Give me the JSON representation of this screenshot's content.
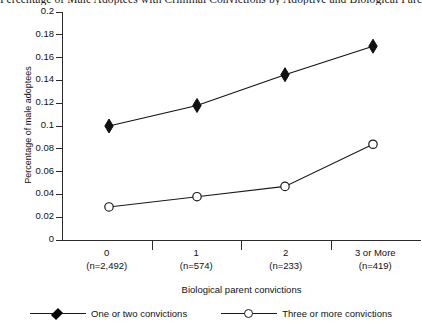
{
  "chart_data": {
    "type": "line",
    "title": "Percentage of Male Adoptees with Criminal Convictions by Adoptive and Biological Parent Criminal Convictions",
    "xlabel": "Biological parent convictions",
    "ylabel": "Percentage of male adoptees",
    "categories": [
      "0",
      "1",
      "2",
      "3 or More"
    ],
    "category_counts": [
      "(n=2,492)",
      "(n=574)",
      "(n=233)",
      "(n=419)"
    ],
    "ylim": [
      0,
      0.2
    ],
    "ytick_labels": [
      "0",
      "0.02",
      "0.04",
      "0.06",
      "0.08",
      "0.1",
      "0.12",
      "0.14",
      "0.16",
      "0.18",
      "0.2"
    ],
    "ytick_values": [
      0,
      0.02,
      0.04,
      0.06,
      0.08,
      0.1,
      0.12,
      0.14,
      0.16,
      0.18,
      0.2
    ],
    "grid": false,
    "legend_position": "bottom",
    "series": [
      {
        "name": "One or two convictions",
        "marker": "filled-diamond",
        "color": "#111111",
        "values": [
          0.1,
          0.118,
          0.145,
          0.17
        ]
      },
      {
        "name": "Three or more convictions",
        "marker": "open-circle",
        "color": "#1a1a1a",
        "values": [
          0.029,
          0.038,
          0.047,
          0.084
        ]
      }
    ]
  },
  "legend": {
    "items": [
      {
        "label": "One or two convictions"
      },
      {
        "label": "Three or more convictions"
      }
    ]
  }
}
